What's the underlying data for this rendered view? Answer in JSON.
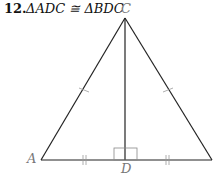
{
  "problem": {
    "number": "12.",
    "statement": "ΔADC ≅ ΔBDC"
  },
  "labels": {
    "C": "C",
    "A": "A",
    "D": "D"
  },
  "figure": {
    "points": {
      "A": [
        41,
        160
      ],
      "B": [
        212,
        160
      ],
      "C": [
        125,
        18
      ],
      "D": [
        125,
        160
      ]
    },
    "marks": [
      "AD = DB (double tick)",
      "AC = BC (single tick)",
      "CD ⟂ AB (right angle)"
    ]
  }
}
